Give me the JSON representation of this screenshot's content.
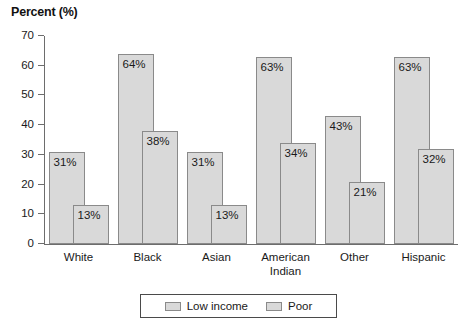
{
  "chart_data": {
    "type": "bar",
    "title": "Percent (%)",
    "xlabel": "",
    "ylabel": "Percent (%)",
    "ylim": [
      0,
      70
    ],
    "ytick_step": 10,
    "yticks": [
      70,
      60,
      50,
      40,
      30,
      20,
      10,
      0
    ],
    "ytick_labels": [
      "70",
      "60",
      "50",
      "40",
      "30",
      "20",
      "10",
      "0"
    ],
    "grid": false,
    "legend_position": "bottom-center",
    "bar_style": "overlapping-grouped",
    "categories": [
      "White",
      "Black",
      "Asian",
      "American Indian",
      "Other",
      "Hispanic"
    ],
    "category_lines": [
      [
        "White"
      ],
      [
        "Black"
      ],
      [
        "Asian"
      ],
      [
        "American",
        "Indian"
      ],
      [
        "Other"
      ],
      [
        "Hispanic"
      ]
    ],
    "series": [
      {
        "name": "Low income",
        "values": [
          31,
          64,
          31,
          63,
          43,
          63
        ],
        "labels": [
          "31%",
          "64%",
          "31%",
          "63%",
          "43%",
          "63%"
        ]
      },
      {
        "name": "Poor",
        "values": [
          13,
          38,
          13,
          34,
          21,
          32
        ],
        "labels": [
          "13%",
          "38%",
          "13%",
          "34%",
          "21%",
          "32%"
        ]
      }
    ]
  },
  "legend": {
    "entries": [
      {
        "label": "Low income",
        "swatch": "legend-swatch-low-income"
      },
      {
        "label": "Poor",
        "swatch": "legend-swatch-poor"
      }
    ]
  },
  "colors": {
    "bar_fill": "#d9d9d9",
    "bar_border": "#8a8a8a",
    "axis": "#6d6d6d",
    "text": "#1a1a1a",
    "background": "#ffffff"
  }
}
